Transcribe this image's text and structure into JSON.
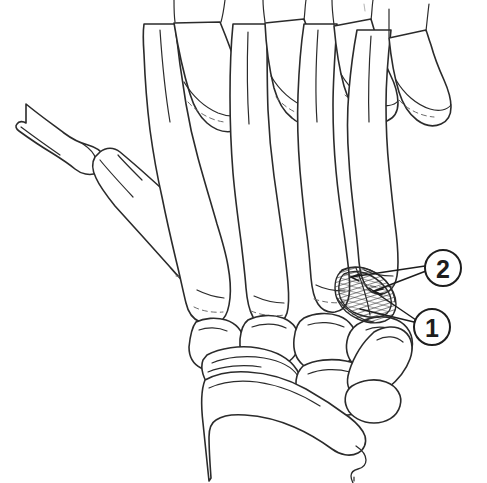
{
  "figure": {
    "title": "Hand skeleton dorsal view line drawing",
    "background_color": "#ffffff",
    "line_color": "#2b2b2b",
    "width": 487,
    "height": 483
  },
  "callouts": [
    {
      "id": "callout-2",
      "label": "2",
      "center_x": 443,
      "center_y": 268,
      "radius": 18,
      "target_x": 349,
      "target_y": 277,
      "description": "Upper numbered callout pointing to the proximal edge of the hatched area"
    },
    {
      "id": "callout-1",
      "label": "1",
      "center_x": 432,
      "center_y": 327,
      "radius": 18,
      "target_x": 367,
      "target_y": 290,
      "description": "Lower numbered callout pointing into the hatched area"
    }
  ],
  "annotations": {
    "shaded_region": {
      "name": "hatched-lesion-region",
      "fill_style": "diagonal-hatch",
      "bounds": {
        "x": 336,
        "y": 266,
        "width": 62,
        "height": 58
      }
    },
    "faint_tick": {
      "name": "faint-tick-mark",
      "x": 364,
      "y": 6
    }
  },
  "bones": {
    "thumb": [
      "thumb-proximal-phalanx",
      "first-metacarpal"
    ],
    "fingers": [
      "index-proximal-phalanx",
      "middle-proximal-phalanx",
      "ring-proximal-phalanx",
      "little-proximal-phalanx"
    ],
    "metacarpals": [
      "second-metacarpal",
      "third-metacarpal",
      "fourth-metacarpal",
      "fifth-metacarpal"
    ],
    "carpals": [
      "trapezium",
      "trapezoid",
      "capitate",
      "hamate",
      "scaphoid",
      "lunate",
      "triquetrum"
    ],
    "forearm": [
      "distal-radius",
      "distal-ulna"
    ]
  },
  "colors": {
    "ink": "#2b2b2b",
    "ink_dark": "#1d1d1d",
    "ink_faint": "#6a6a6a",
    "paper": "#ffffff"
  }
}
